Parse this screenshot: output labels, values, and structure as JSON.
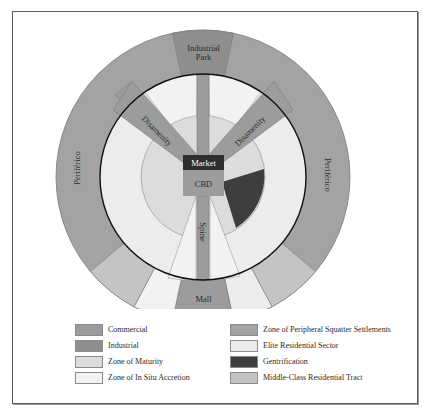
{
  "diagram": {
    "type": "urban land-use model (Latin American city)",
    "center_labels": {
      "market": "Market",
      "cbd": "CBD",
      "spine": "Spine"
    },
    "sector_labels": {
      "industrial_park_line1": "Industrial",
      "industrial_park_line2": "Park",
      "disamenity_left": "Disamenity",
      "disamenity_right": "Disamenity",
      "periferico_left": "Periférico",
      "periferico_right": "Periférico",
      "mall": "Mall"
    }
  },
  "legend": {
    "items": [
      {
        "label": "Commercial",
        "color": "#9c9c9c"
      },
      {
        "label": "Zone of Peripheral Squatter Settlements",
        "color": "#a3a3a3"
      },
      {
        "label": "Industrial",
        "color": "#8e8e8e"
      },
      {
        "label": "Elite Residential Sector",
        "color": "#ececec"
      },
      {
        "label": "Zone of Maturity",
        "color": "#dcdcdc"
      },
      {
        "label": "Gentrification",
        "color": "#3e3e3e"
      },
      {
        "label": "Zone of In Situ Accretion",
        "color": "#f2f2f2"
      },
      {
        "label": "Middle-Class Residential Tract",
        "color": "#c4c4c4"
      }
    ]
  },
  "colors": {
    "commercial": "#9c9c9c",
    "industrial": "#8e8e8e",
    "maturity": "#dcdcdc",
    "in_situ": "#f2f2f2",
    "squatter": "#a3a3a3",
    "elite": "#ececec",
    "gentrification": "#3e3e3e",
    "middle_class": "#c4c4c4",
    "market": "#2e2e2e"
  }
}
